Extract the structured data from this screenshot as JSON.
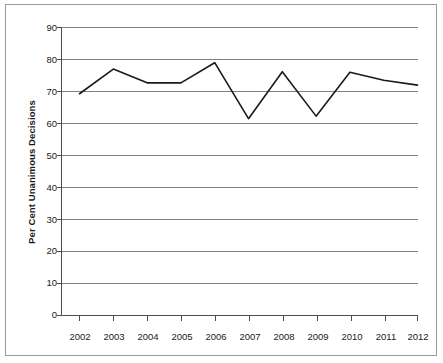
{
  "chart_data": {
    "type": "line",
    "title": "",
    "subtitle": "",
    "xlabel": "",
    "ylabel": "Per Cent Unanimous Decisions",
    "categories": [
      "2002",
      "2003",
      "2004",
      "2005",
      "2006",
      "2007",
      "2008",
      "2009",
      "2010",
      "2011",
      "2012"
    ],
    "values": [
      69.3,
      77.0,
      72.7,
      72.7,
      79.0,
      61.5,
      76.2,
      62.3,
      76.0,
      73.5,
      72.0
    ],
    "series": [
      {
        "name": "Per Cent Unanimous Decisions",
        "values": [
          69.3,
          77.0,
          72.7,
          72.7,
          79.0,
          61.5,
          76.2,
          62.3,
          76.0,
          73.5,
          72.0
        ],
        "color": "#1a1a1a"
      }
    ],
    "ylim": [
      0,
      90
    ],
    "xlim": [
      "2002",
      "2012"
    ],
    "yticks": [
      0,
      10,
      20,
      30,
      40,
      50,
      60,
      70,
      80,
      90
    ],
    "ytick_labels": [
      "0",
      "10",
      "20",
      "30",
      "40",
      "50",
      "60",
      "70",
      "80",
      "90"
    ],
    "xtick_labels": [
      "2002",
      "2003",
      "2004",
      "2005",
      "2006",
      "2007",
      "2008",
      "2009",
      "2010",
      "2011",
      "2012"
    ],
    "grid": {
      "horizontal": true,
      "vertical": false,
      "color": "#808080"
    },
    "legend": {
      "visible": false,
      "position": "none",
      "entries": []
    },
    "annotations": [],
    "axis_color": "#4d4d4d",
    "line_color": "#1a1a1a",
    "background": "#ffffff"
  },
  "frame": {
    "border_color": "#9a9a9a"
  }
}
